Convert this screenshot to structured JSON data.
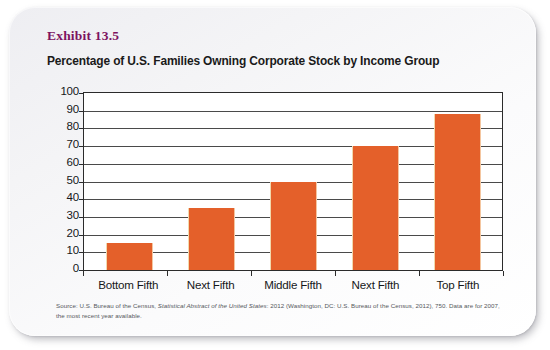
{
  "exhibit": {
    "label": "Exhibit 13.5",
    "label_color": "#7d1360"
  },
  "title": "Percentage of U.S. Families Owning Corporate Stock by Income Group",
  "source_note": {
    "prefix": "Source: U.S. Bureau of the Census, ",
    "italic_title": "Statistical Abstract of the United States",
    "suffix": ": 2012 (Washington, DC: U.S. Bureau of the Census, 2012), 750. Data are for 2007, the most recent year available."
  },
  "chart_data": {
    "type": "bar",
    "title": "Percentage of U.S. Families Owning Corporate Stock by Income Group",
    "subtitle": "Exhibit 13.5",
    "categories": [
      "Bottom Fifth",
      "Next Fifth",
      "Middle Fifth",
      "Next Fifth",
      "Top Fifth"
    ],
    "values": [
      15,
      35,
      50,
      70,
      88
    ],
    "xlabel": "",
    "ylabel": "",
    "ylim": [
      0,
      100
    ],
    "ytick_labels": [
      "100",
      "90",
      "80",
      "70",
      "60",
      "50",
      "40",
      "30",
      "20",
      "10",
      "0"
    ],
    "ytick_values": [
      100,
      90,
      80,
      70,
      60,
      50,
      40,
      30,
      20,
      10,
      0
    ],
    "ytick_step": 10,
    "grid": true,
    "grid_axis": "y",
    "legend": false,
    "bar_color": "#e4602a",
    "axis_color": "#2b2b2b"
  }
}
